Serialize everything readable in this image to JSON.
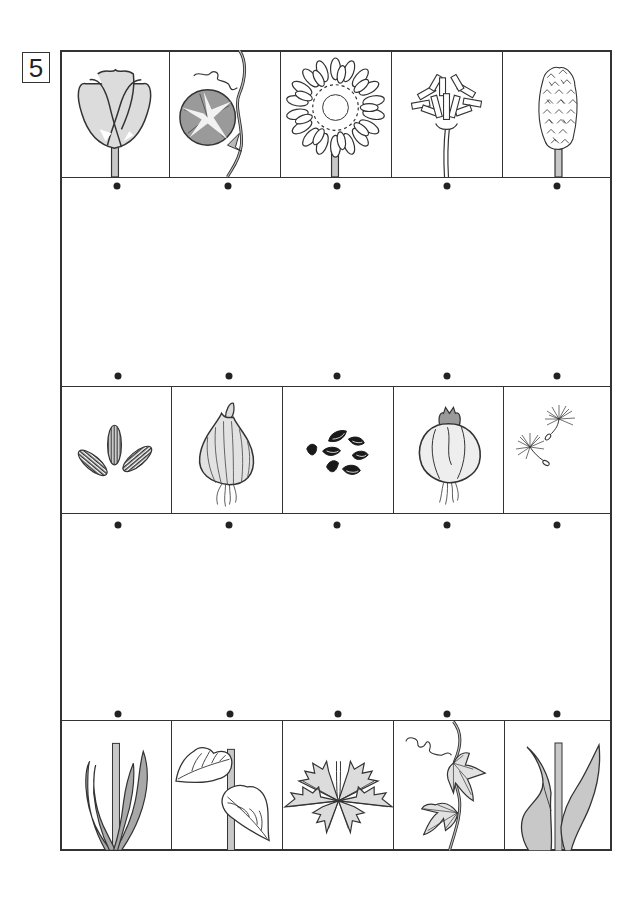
{
  "worksheet": {
    "number_label": "5",
    "task": "match each flower to its seed/bulb and to its leaves by connecting dots",
    "line_color": "#333333",
    "fill_light_gray": "#dcdcdc",
    "fill_mid_gray": "#9a9a9a"
  },
  "rows": [
    {
      "name": "flowers",
      "items": [
        {
          "id": "tulip",
          "icon": "tulip-flower-icon"
        },
        {
          "id": "morning-glory",
          "icon": "morning-glory-flower-icon"
        },
        {
          "id": "sunflower",
          "icon": "sunflower-flower-icon"
        },
        {
          "id": "dandelion",
          "icon": "dandelion-flower-icon"
        },
        {
          "id": "hyacinth",
          "icon": "hyacinth-flower-icon"
        }
      ]
    },
    {
      "name": "seeds-and-bulbs",
      "items": [
        {
          "id": "sunflower-seeds",
          "icon": "sunflower-seeds-icon"
        },
        {
          "id": "tulip-bulb",
          "icon": "tulip-bulb-icon"
        },
        {
          "id": "morning-glory-seeds",
          "icon": "black-seeds-icon"
        },
        {
          "id": "hyacinth-bulb",
          "icon": "hyacinth-bulb-icon"
        },
        {
          "id": "dandelion-seeds",
          "icon": "dandelion-seed-fluff-icon"
        }
      ]
    },
    {
      "name": "leaves",
      "items": [
        {
          "id": "hyacinth-leaves",
          "icon": "narrow-leaves-icon"
        },
        {
          "id": "sunflower-leaves",
          "icon": "serrated-leaves-icon"
        },
        {
          "id": "dandelion-leaves",
          "icon": "dandelion-rosette-icon"
        },
        {
          "id": "morning-glory-leaves",
          "icon": "vine-leaves-icon"
        },
        {
          "id": "tulip-leaves",
          "icon": "broad-leaves-icon"
        }
      ]
    }
  ],
  "connection_dots": {
    "count_per_row": 5,
    "rows_y": [
      186,
      376,
      525,
      714
    ]
  }
}
